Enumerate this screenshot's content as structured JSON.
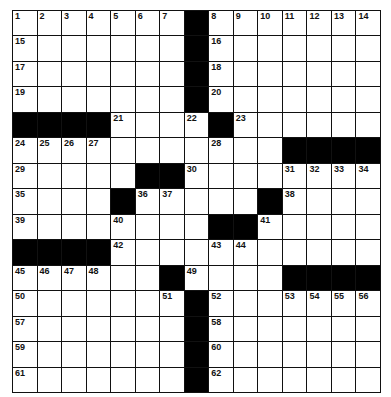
{
  "puzzle": {
    "rows": 15,
    "cols": 15,
    "colors": {
      "black": "#000000",
      "white": "#ffffff",
      "line": "#111111"
    },
    "blacks": [
      [
        0,
        7
      ],
      [
        1,
        7
      ],
      [
        2,
        7
      ],
      [
        3,
        7
      ],
      [
        4,
        0
      ],
      [
        4,
        1
      ],
      [
        4,
        2
      ],
      [
        4,
        3
      ],
      [
        4,
        8
      ],
      [
        5,
        11
      ],
      [
        5,
        12
      ],
      [
        5,
        13
      ],
      [
        5,
        14
      ],
      [
        6,
        5
      ],
      [
        6,
        6
      ],
      [
        7,
        4
      ],
      [
        7,
        10
      ],
      [
        8,
        8
      ],
      [
        8,
        9
      ],
      [
        9,
        0
      ],
      [
        9,
        1
      ],
      [
        9,
        2
      ],
      [
        9,
        3
      ],
      [
        10,
        6
      ],
      [
        10,
        11
      ],
      [
        10,
        12
      ],
      [
        10,
        13
      ],
      [
        10,
        14
      ],
      [
        11,
        7
      ],
      [
        12,
        7
      ],
      [
        13,
        7
      ],
      [
        14,
        7
      ]
    ],
    "numbers": [
      [
        0,
        0,
        1
      ],
      [
        0,
        1,
        2
      ],
      [
        0,
        2,
        3
      ],
      [
        0,
        3,
        4
      ],
      [
        0,
        4,
        5
      ],
      [
        0,
        5,
        6
      ],
      [
        0,
        6,
        7
      ],
      [
        0,
        8,
        8
      ],
      [
        0,
        9,
        9
      ],
      [
        0,
        10,
        10
      ],
      [
        0,
        11,
        11
      ],
      [
        0,
        12,
        12
      ],
      [
        0,
        13,
        13
      ],
      [
        0,
        14,
        14
      ],
      [
        1,
        0,
        15
      ],
      [
        1,
        8,
        16
      ],
      [
        2,
        0,
        17
      ],
      [
        2,
        8,
        18
      ],
      [
        3,
        0,
        19
      ],
      [
        3,
        8,
        20
      ],
      [
        4,
        4,
        21
      ],
      [
        4,
        7,
        22
      ],
      [
        4,
        9,
        23
      ],
      [
        5,
        0,
        24
      ],
      [
        5,
        1,
        25
      ],
      [
        5,
        2,
        26
      ],
      [
        5,
        3,
        27
      ],
      [
        5,
        8,
        28
      ],
      [
        6,
        0,
        29
      ],
      [
        6,
        7,
        30
      ],
      [
        6,
        11,
        31
      ],
      [
        6,
        12,
        32
      ],
      [
        6,
        13,
        33
      ],
      [
        6,
        14,
        34
      ],
      [
        7,
        0,
        35
      ],
      [
        7,
        5,
        36
      ],
      [
        7,
        6,
        37
      ],
      [
        7,
        11,
        38
      ],
      [
        8,
        0,
        39
      ],
      [
        8,
        4,
        40
      ],
      [
        8,
        10,
        41
      ],
      [
        9,
        4,
        42
      ],
      [
        9,
        8,
        43
      ],
      [
        9,
        9,
        44
      ],
      [
        10,
        0,
        45
      ],
      [
        10,
        1,
        46
      ],
      [
        10,
        2,
        47
      ],
      [
        10,
        3,
        48
      ],
      [
        10,
        7,
        49
      ],
      [
        11,
        0,
        50
      ],
      [
        11,
        6,
        51
      ],
      [
        11,
        8,
        52
      ],
      [
        11,
        11,
        53
      ],
      [
        11,
        12,
        54
      ],
      [
        11,
        13,
        55
      ],
      [
        11,
        14,
        56
      ],
      [
        12,
        0,
        57
      ],
      [
        12,
        8,
        58
      ],
      [
        13,
        0,
        59
      ],
      [
        13,
        8,
        60
      ],
      [
        14,
        0,
        61
      ],
      [
        14,
        8,
        62
      ]
    ]
  }
}
